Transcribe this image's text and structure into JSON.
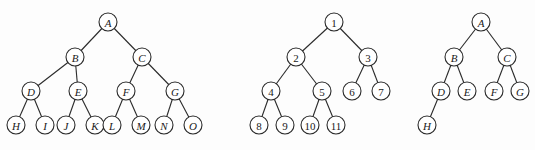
{
  "figure": {
    "trees": [
      {
        "id": "full-binary-tree",
        "label_style": "italic",
        "nodes": [
          {
            "id": "A",
            "label": "A",
            "x": 108,
            "y": 22
          },
          {
            "id": "B",
            "label": "B",
            "x": 75,
            "y": 57
          },
          {
            "id": "C",
            "label": "C",
            "x": 142,
            "y": 57
          },
          {
            "id": "D",
            "label": "D",
            "x": 31,
            "y": 91
          },
          {
            "id": "E",
            "label": "E",
            "x": 78,
            "y": 91
          },
          {
            "id": "F",
            "label": "F",
            "x": 126,
            "y": 91
          },
          {
            "id": "G",
            "label": "G",
            "x": 175,
            "y": 91
          },
          {
            "id": "H",
            "label": "H",
            "x": 16,
            "y": 125
          },
          {
            "id": "I",
            "label": "I",
            "x": 45,
            "y": 125
          },
          {
            "id": "J",
            "label": "J",
            "x": 66,
            "y": 125
          },
          {
            "id": "K",
            "label": "K",
            "x": 95,
            "y": 125
          },
          {
            "id": "L",
            "label": "L",
            "x": 112,
            "y": 125
          },
          {
            "id": "M",
            "label": "M",
            "x": 141,
            "y": 125
          },
          {
            "id": "N",
            "label": "N",
            "x": 164,
            "y": 125
          },
          {
            "id": "O",
            "label": "O",
            "x": 193,
            "y": 125
          }
        ],
        "edges": [
          [
            "A",
            "B"
          ],
          [
            "A",
            "C"
          ],
          [
            "B",
            "D"
          ],
          [
            "B",
            "E"
          ],
          [
            "C",
            "F"
          ],
          [
            "C",
            "G"
          ],
          [
            "D",
            "H"
          ],
          [
            "D",
            "I"
          ],
          [
            "E",
            "J"
          ],
          [
            "E",
            "K"
          ],
          [
            "F",
            "L"
          ],
          [
            "F",
            "M"
          ],
          [
            "G",
            "N"
          ],
          [
            "G",
            "O"
          ]
        ]
      },
      {
        "id": "complete-binary-tree",
        "label_style": "upright",
        "nodes": [
          {
            "id": "1",
            "label": "1",
            "x": 334,
            "y": 22
          },
          {
            "id": "2",
            "label": "2",
            "x": 296,
            "y": 57
          },
          {
            "id": "3",
            "label": "3",
            "x": 368,
            "y": 57
          },
          {
            "id": "4",
            "label": "4",
            "x": 271,
            "y": 91
          },
          {
            "id": "5",
            "label": "5",
            "x": 322,
            "y": 91
          },
          {
            "id": "6",
            "label": "6",
            "x": 352,
            "y": 91
          },
          {
            "id": "7",
            "label": "7",
            "x": 381,
            "y": 91
          },
          {
            "id": "8",
            "label": "8",
            "x": 259,
            "y": 125
          },
          {
            "id": "9",
            "label": "9",
            "x": 285,
            "y": 125
          },
          {
            "id": "10",
            "label": "10",
            "x": 310,
            "y": 125
          },
          {
            "id": "11",
            "label": "11",
            "x": 336,
            "y": 125
          }
        ],
        "edges": [
          [
            "1",
            "2"
          ],
          [
            "1",
            "3"
          ],
          [
            "2",
            "4"
          ],
          [
            "2",
            "5"
          ],
          [
            "3",
            "6"
          ],
          [
            "3",
            "7"
          ],
          [
            "4",
            "8"
          ],
          [
            "4",
            "9"
          ],
          [
            "5",
            "10"
          ],
          [
            "5",
            "11"
          ]
        ]
      },
      {
        "id": "non-complete-binary-tree",
        "label_style": "italic",
        "nodes": [
          {
            "id": "A",
            "label": "A",
            "x": 481,
            "y": 22
          },
          {
            "id": "B",
            "label": "B",
            "x": 454,
            "y": 57
          },
          {
            "id": "C",
            "label": "C",
            "x": 507,
            "y": 57
          },
          {
            "id": "D",
            "label": "D",
            "x": 441,
            "y": 91
          },
          {
            "id": "E",
            "label": "E",
            "x": 467,
            "y": 91
          },
          {
            "id": "F",
            "label": "F",
            "x": 494,
            "y": 91
          },
          {
            "id": "G",
            "label": "G",
            "x": 520,
            "y": 91
          },
          {
            "id": "H",
            "label": "H",
            "x": 427,
            "y": 125
          }
        ],
        "edges": [
          [
            "A",
            "B"
          ],
          [
            "A",
            "C"
          ],
          [
            "B",
            "D"
          ],
          [
            "B",
            "E"
          ],
          [
            "C",
            "F"
          ],
          [
            "C",
            "G"
          ],
          [
            "D",
            "H"
          ]
        ]
      }
    ],
    "node_radius": 9,
    "colors": {
      "stroke": "#2a2a2a",
      "fill": "#ffffff",
      "text": "#1a1a1a",
      "background": "#fdfdfd"
    }
  }
}
